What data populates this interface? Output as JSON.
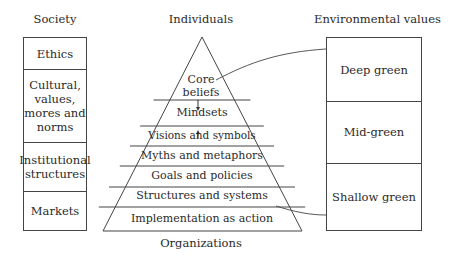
{
  "headers": {
    "society": "Society",
    "individuals": "Individuals",
    "environmental": "Environmental values",
    "organizations": "Organizations"
  },
  "society": [
    "Ethics",
    "Cultural, values, mores and norms",
    "Institutional structures",
    "Markets"
  ],
  "society_lines": [
    [
      "Ethics"
    ],
    [
      "Cultural,",
      "values,",
      "mores and",
      "norms"
    ],
    [
      "Institutional",
      "structures"
    ],
    [
      "Markets"
    ]
  ],
  "pyramid": [
    "Core beliefs",
    "Mindsets",
    "Visions and symbols",
    "Myths and metaphors",
    "Goals and policies",
    "Structures and systems",
    "Implementation as action"
  ],
  "pyramid_core_lines": [
    "Core",
    "beliefs"
  ],
  "environmental": [
    "Deep green",
    "Mid-green",
    "Shallow green"
  ]
}
